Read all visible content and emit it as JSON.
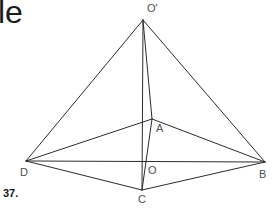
{
  "page": {
    "width": 273,
    "height": 209,
    "background": "#ffffff",
    "stroke_color": "#2b2b2b",
    "label_color": "#4e4e4e",
    "corner_text": "le",
    "item_number": "37."
  },
  "figure": {
    "type": "pyramid-diagram",
    "vertices": [
      {
        "id": "Oprime",
        "label": "O'",
        "x": 143,
        "y": 20,
        "label_x": 147,
        "label_y": 2
      },
      {
        "id": "A",
        "label": "A",
        "x": 152,
        "y": 119,
        "label_x": 156,
        "label_y": 122
      },
      {
        "id": "B",
        "label": "B",
        "x": 265,
        "y": 162,
        "label_x": 259,
        "label_y": 168
      },
      {
        "id": "C",
        "label": "C",
        "x": 142,
        "y": 190,
        "label_x": 138,
        "label_y": 193
      },
      {
        "id": "D",
        "label": "D",
        "x": 26,
        "y": 161,
        "label_x": 20,
        "label_y": 166
      },
      {
        "id": "O",
        "label": "O",
        "x": 144,
        "y": 161,
        "label_x": 148,
        "label_y": 164
      }
    ],
    "edges": [
      {
        "from": "Oprime",
        "to": "D"
      },
      {
        "from": "Oprime",
        "to": "B"
      },
      {
        "from": "Oprime",
        "to": "A"
      },
      {
        "from": "Oprime",
        "to": "C"
      },
      {
        "from": "D",
        "to": "A"
      },
      {
        "from": "A",
        "to": "B"
      },
      {
        "from": "D",
        "to": "B"
      },
      {
        "from": "D",
        "to": "C"
      },
      {
        "from": "C",
        "to": "B"
      },
      {
        "from": "A",
        "to": "C"
      }
    ]
  }
}
